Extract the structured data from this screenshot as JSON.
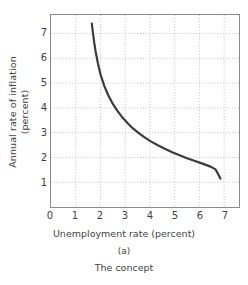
{
  "chart_data": {
    "type": "line",
    "title": "",
    "subtitle": "The concept",
    "panel_label": "(a)",
    "xlabel": "Unemployment rate (percent)",
    "ylabel": "Annual rate of inflation (percent)",
    "ylabel_line1": "Annual rate of inflation",
    "ylabel_line2": "(percent)",
    "xlim": [
      0,
      7.6
    ],
    "ylim": [
      0,
      7.75
    ],
    "xticks": [
      0,
      1,
      2,
      3,
      4,
      5,
      6,
      7
    ],
    "xticklabels": [
      "0",
      "1",
      "2",
      "3",
      "4",
      "5",
      "6",
      "7"
    ],
    "yticks": [
      1,
      2,
      3,
      4,
      5,
      6,
      7
    ],
    "yticklabels": [
      "1",
      "2",
      "3",
      "4",
      "5",
      "6",
      "7"
    ],
    "grid": true,
    "grid_style": "dotted",
    "grid_color": "#bfbfbf",
    "legend": false,
    "series": [
      {
        "name": "Phillips curve",
        "color": "#3a3a3a",
        "linewidth": 2.2,
        "x": [
          1.65,
          1.7,
          1.75,
          1.8,
          1.9,
          2.0,
          2.15,
          2.3,
          2.5,
          2.7,
          2.9,
          3.1,
          3.3,
          3.55,
          3.8,
          4.05,
          4.3,
          4.6,
          4.9,
          5.2,
          5.5,
          5.85,
          6.15,
          6.45,
          6.65,
          6.85
        ],
        "y": [
          7.4,
          7.0,
          6.62,
          6.3,
          5.78,
          5.36,
          4.9,
          4.54,
          4.16,
          3.86,
          3.6,
          3.38,
          3.18,
          2.98,
          2.8,
          2.64,
          2.5,
          2.35,
          2.21,
          2.09,
          1.97,
          1.85,
          1.74,
          1.63,
          1.52,
          1.15
        ]
      }
    ],
    "annotations": []
  },
  "axis": {
    "frame_color": "#8a8a8a",
    "tick_color": "#3f3f3f"
  },
  "colors": {
    "curve": "#3a3a3a",
    "grid": "#bfbfbf",
    "frame": "#8a8a8a",
    "text": "#3f3f3f",
    "background": "#ffffff"
  }
}
